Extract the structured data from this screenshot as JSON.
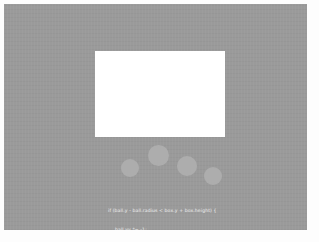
{
  "app": {
    "title": "Canvas Ball Bounce",
    "page_background": "#fdfdfd"
  },
  "canvas": {
    "name": "animation-canvas",
    "background_color": "#9a9a9a",
    "x": 4,
    "y": 4,
    "width": 303,
    "height": 226
  },
  "box": {
    "label": "box",
    "fill_color": "#ffffff",
    "x": 91,
    "y": 47,
    "width": 130,
    "height": 86
  },
  "balls": {
    "fill_color": "#adadad",
    "items": [
      {
        "label": "ball-trail-1",
        "cx": 126,
        "cy": 164,
        "r": 9
      },
      {
        "label": "ball-trail-2",
        "cx": 154,
        "cy": 151,
        "r": 10.5
      },
      {
        "label": "ball-trail-3",
        "cx": 183,
        "cy": 162,
        "r": 10
      },
      {
        "label": "ball-trail-4",
        "cx": 209,
        "cy": 172,
        "r": 9
      }
    ]
  },
  "code": {
    "text_color": "#e8e8e8",
    "lines": [
      "if (ball.y - ball.radius < box.y + box.height) {",
      "ball.vy *= -1;",
      "}"
    ]
  }
}
